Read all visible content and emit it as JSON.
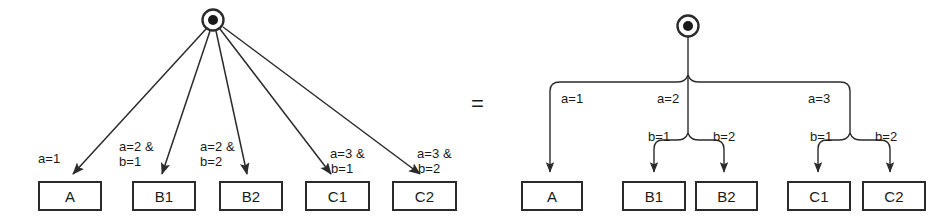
{
  "figure": {
    "type": "diagram",
    "relation_symbol": "=",
    "stroke_color": "#2b2b2b",
    "background_color": "#ffffff"
  },
  "left_graph": {
    "root": {
      "label": "",
      "icon": "initial-state-node"
    },
    "nodes": [
      {
        "id": "A",
        "label": "A",
        "x": 38,
        "y": 181,
        "w": 64,
        "h": 30
      },
      {
        "id": "B1",
        "label": "B1",
        "x": 132,
        "y": 181,
        "w": 64,
        "h": 30
      },
      {
        "id": "B2",
        "label": "B2",
        "x": 219,
        "y": 181,
        "w": 64,
        "h": 30
      },
      {
        "id": "C1",
        "label": "C1",
        "x": 305,
        "y": 181,
        "w": 65,
        "h": 30
      },
      {
        "id": "C2",
        "label": "C2",
        "x": 392,
        "y": 181,
        "w": 65,
        "h": 30
      }
    ],
    "edges": [
      {
        "target": "A",
        "label": "a=1",
        "label_lines": [
          "a=1"
        ]
      },
      {
        "target": "B1",
        "label": "a=2 & b=1",
        "label_lines": [
          "a=2 &",
          "b=1"
        ]
      },
      {
        "target": "B2",
        "label": "a=2 & b=2",
        "label_lines": [
          "a=2 &",
          "b=2"
        ]
      },
      {
        "target": "C1",
        "label": "a=3 & b=1",
        "label_lines": [
          "a=3 &",
          "b=1"
        ]
      },
      {
        "target": "C2",
        "label": "a=3 & b=2",
        "label_lines": [
          "a=3 &",
          "b=2"
        ]
      }
    ]
  },
  "right_graph": {
    "root": {
      "label": "",
      "icon": "initial-state-node"
    },
    "nodes": [
      {
        "id": "A",
        "label": "A",
        "x": 521,
        "y": 181,
        "w": 62,
        "h": 30
      },
      {
        "id": "B1",
        "label": "B1",
        "x": 622,
        "y": 181,
        "w": 64,
        "h": 30
      },
      {
        "id": "B2",
        "label": "B2",
        "x": 695,
        "y": 181,
        "w": 63,
        "h": 30
      },
      {
        "id": "C1",
        "label": "C1",
        "x": 787,
        "y": 181,
        "w": 64,
        "h": 30
      },
      {
        "id": "C2",
        "label": "C2",
        "x": 862,
        "y": 181,
        "w": 64,
        "h": 30
      }
    ],
    "edges": [
      {
        "level": 1,
        "label": "a=1"
      },
      {
        "level": 1,
        "label": "a=2"
      },
      {
        "level": 1,
        "label": "a=3"
      },
      {
        "level": 2,
        "label": "b=1",
        "parent": "a=2",
        "target": "B1"
      },
      {
        "level": 2,
        "label": "b=2",
        "parent": "a=2",
        "target": "B2"
      },
      {
        "level": 2,
        "label": "b=1",
        "parent": "a=3",
        "target": "C1"
      },
      {
        "level": 2,
        "label": "b=2",
        "parent": "a=3",
        "target": "C2"
      }
    ]
  }
}
